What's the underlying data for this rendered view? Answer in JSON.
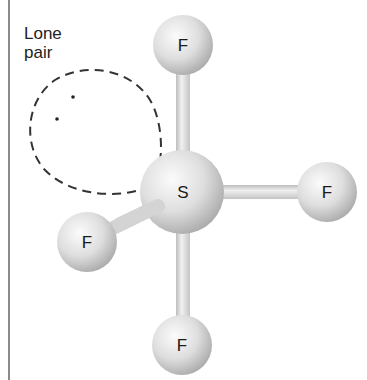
{
  "diagram": {
    "caption": {
      "line1": "Lone",
      "line2": "pair"
    },
    "central_atom": {
      "symbol": "S"
    },
    "outer_atoms": [
      {
        "position": "top",
        "symbol": "F"
      },
      {
        "position": "right",
        "symbol": "F"
      },
      {
        "position": "lower-left",
        "symbol": "F"
      },
      {
        "position": "bottom",
        "symbol": "F"
      }
    ],
    "lone_pair": {
      "electrons": 2,
      "style": "dashed-lobe"
    },
    "colors": {
      "atom_light": "#f8f8f8",
      "atom_mid": "#d6d6d6",
      "atom_dark": "#a8a8a8",
      "bond": "#d8d8d8",
      "dash": "#333333",
      "frame": "#8a8a8a"
    }
  }
}
